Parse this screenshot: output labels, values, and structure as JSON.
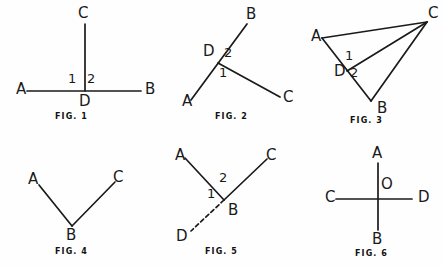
{
  "canvas": {
    "width": 443,
    "height": 267,
    "background": "#fefefe",
    "stroke_color": "#1a1a1a",
    "text_color": "#1a1a1a"
  },
  "figures": [
    {
      "id": "fig-1",
      "caption": "FIG. 1",
      "description": "Straight line A-B with perpendicular ray D-C at point D",
      "points": [
        {
          "name": "A",
          "label": "A",
          "x": 16,
          "y": 82
        },
        {
          "name": "B",
          "label": "B",
          "x": 145,
          "y": 82
        },
        {
          "name": "C",
          "label": "C",
          "x": 78,
          "y": 6
        },
        {
          "name": "D",
          "label": "D",
          "x": 79,
          "y": 94
        }
      ],
      "angles": [
        {
          "name": "angle-1",
          "label": "1",
          "x": 68,
          "y": 72
        },
        {
          "name": "angle-2",
          "label": "2",
          "x": 87,
          "y": 72
        }
      ],
      "segments": [
        {
          "name": "segment-ab",
          "x1": 27,
          "y1": 91,
          "x2": 141,
          "y2": 91,
          "style": "solid"
        },
        {
          "name": "segment-dc",
          "x1": 85,
          "y1": 91,
          "x2": 85,
          "y2": 24,
          "style": "solid"
        }
      ],
      "caption_x": 55,
      "caption_y": 113
    },
    {
      "id": "fig-2",
      "caption": "FIG. 2",
      "description": "Straight line A-B through D with ray D-C",
      "points": [
        {
          "name": "A",
          "label": "A",
          "x": 182,
          "y": 94
        },
        {
          "name": "B",
          "label": "B",
          "x": 246,
          "y": 7
        },
        {
          "name": "C",
          "label": "C",
          "x": 283,
          "y": 90
        },
        {
          "name": "D",
          "label": "D",
          "x": 203,
          "y": 44
        }
      ],
      "angles": [
        {
          "name": "angle-1",
          "label": "1",
          "x": 219,
          "y": 66
        },
        {
          "name": "angle-2",
          "label": "2",
          "x": 224,
          "y": 46
        }
      ],
      "segments": [
        {
          "name": "segment-ab",
          "x1": 191,
          "y1": 100,
          "x2": 247,
          "y2": 24,
          "style": "solid"
        },
        {
          "name": "segment-dc",
          "x1": 218,
          "y1": 63,
          "x2": 280,
          "y2": 97,
          "style": "solid"
        }
      ],
      "caption_x": 215,
      "caption_y": 113
    },
    {
      "id": "fig-3",
      "caption": "FIG. 3",
      "description": "Triangle A-B-C with cevian C-D meeting side AB at D",
      "points": [
        {
          "name": "A",
          "label": "A",
          "x": 311,
          "y": 29
        },
        {
          "name": "B",
          "label": "B",
          "x": 377,
          "y": 101
        },
        {
          "name": "C",
          "label": "C",
          "x": 428,
          "y": 6
        },
        {
          "name": "D",
          "label": "D",
          "x": 334,
          "y": 64
        }
      ],
      "angles": [
        {
          "name": "angle-1",
          "label": "1",
          "x": 345,
          "y": 49
        },
        {
          "name": "angle-2",
          "label": "2",
          "x": 350,
          "y": 66
        }
      ],
      "segments": [
        {
          "name": "segment-ac",
          "x1": 322,
          "y1": 38,
          "x2": 427,
          "y2": 22,
          "style": "solid"
        },
        {
          "name": "segment-ab",
          "x1": 322,
          "y1": 38,
          "x2": 371,
          "y2": 101,
          "style": "solid"
        },
        {
          "name": "segment-bc",
          "x1": 371,
          "y1": 101,
          "x2": 427,
          "y2": 22,
          "style": "solid"
        },
        {
          "name": "segment-dc",
          "x1": 347,
          "y1": 71,
          "x2": 427,
          "y2": 22,
          "style": "solid"
        }
      ],
      "caption_x": 350,
      "caption_y": 117
    },
    {
      "id": "fig-4",
      "caption": "FIG. 4",
      "description": "Angle A-B-C with vertex B at the bottom",
      "points": [
        {
          "name": "A",
          "label": "A",
          "x": 28,
          "y": 172
        },
        {
          "name": "B",
          "label": "B",
          "x": 66,
          "y": 228
        },
        {
          "name": "C",
          "label": "C",
          "x": 113,
          "y": 170
        }
      ],
      "angles": [],
      "segments": [
        {
          "name": "segment-ba",
          "x1": 72,
          "y1": 226,
          "x2": 39,
          "y2": 185,
          "style": "solid"
        },
        {
          "name": "segment-bc",
          "x1": 72,
          "y1": 226,
          "x2": 115,
          "y2": 182,
          "style": "solid"
        }
      ],
      "caption_x": 55,
      "caption_y": 248
    },
    {
      "id": "fig-5",
      "caption": "FIG. 5",
      "description": "Rays B-A and B-C from vertex B with dashed ray B-D",
      "points": [
        {
          "name": "A",
          "label": "A",
          "x": 175,
          "y": 148
        },
        {
          "name": "B",
          "label": "B",
          "x": 228,
          "y": 203
        },
        {
          "name": "C",
          "label": "C",
          "x": 266,
          "y": 148
        },
        {
          "name": "D",
          "label": "D",
          "x": 176,
          "y": 229
        }
      ],
      "angles": [
        {
          "name": "angle-1",
          "label": "1",
          "x": 207,
          "y": 187
        },
        {
          "name": "angle-2",
          "label": "2",
          "x": 219,
          "y": 171
        }
      ],
      "segments": [
        {
          "name": "segment-ba",
          "x1": 224,
          "y1": 200,
          "x2": 185,
          "y2": 158,
          "style": "solid"
        },
        {
          "name": "segment-bc",
          "x1": 224,
          "y1": 200,
          "x2": 267,
          "y2": 159,
          "style": "solid"
        },
        {
          "name": "segment-bd",
          "x1": 224,
          "y1": 200,
          "x2": 191,
          "y2": 231,
          "style": "dashed"
        }
      ],
      "caption_x": 205,
      "caption_y": 248
    },
    {
      "id": "fig-6",
      "caption": "FIG. 6",
      "description": "Perpendicular lines A-B and C-D intersecting at O",
      "points": [
        {
          "name": "A",
          "label": "A",
          "x": 372,
          "y": 146
        },
        {
          "name": "B",
          "label": "B",
          "x": 372,
          "y": 232
        },
        {
          "name": "C",
          "label": "C",
          "x": 325,
          "y": 190
        },
        {
          "name": "D",
          "label": "D",
          "x": 418,
          "y": 190
        },
        {
          "name": "O",
          "label": "O",
          "x": 381,
          "y": 177
        }
      ],
      "angles": [],
      "segments": [
        {
          "name": "segment-ab",
          "x1": 378,
          "y1": 163,
          "x2": 378,
          "y2": 230,
          "style": "solid"
        },
        {
          "name": "segment-cd",
          "x1": 336,
          "y1": 199,
          "x2": 412,
          "y2": 199,
          "style": "solid"
        }
      ],
      "caption_x": 355,
      "caption_y": 250
    }
  ]
}
